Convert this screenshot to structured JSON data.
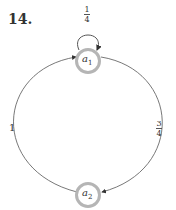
{
  "problem": {
    "number": "14."
  },
  "diagram": {
    "type": "state-transition-graph",
    "nodes": [
      {
        "id": "a1",
        "label": "a",
        "subscript": "1"
      },
      {
        "id": "a2",
        "label": "a",
        "subscript": "2"
      }
    ],
    "edges": [
      {
        "from": "a1",
        "to": "a1",
        "weight": {
          "num": "1",
          "den": "4"
        }
      },
      {
        "from": "a1",
        "to": "a2",
        "weight": {
          "num": "3",
          "den": "4"
        }
      },
      {
        "from": "a2",
        "to": "a1",
        "weight": "1"
      }
    ],
    "colors": {
      "node_ring": "#b5b5b5",
      "edge": "#555555",
      "text": "#333333"
    }
  }
}
